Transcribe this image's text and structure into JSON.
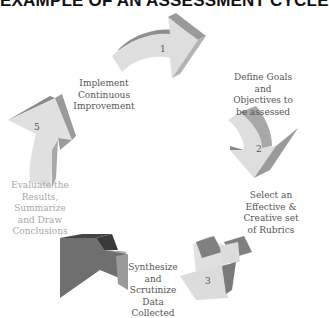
{
  "title": "EXAMPLE OF AN ASSESSMENT CYCLE",
  "steps": [
    {
      "number": "1",
      "label": "",
      "arrow_color": "#d6d6d6"
    },
    {
      "number": "2",
      "label": "Define Goals and Objectives to be assessed",
      "lines": [
        "Define Goals",
        "and",
        "Objectives to",
        "be assessed"
      ]
    },
    {
      "number": "3",
      "label": "Select an Effective & Creative set of Rubrics",
      "lines": [
        "Select an",
        "Effective &",
        "Creative set",
        "of  Rubrics"
      ]
    },
    {
      "number": "4",
      "label": "Synthesize and Scrutinize Data Collected",
      "lines": [
        "Synthesize",
        "and",
        "Scrutinize",
        "Data",
        "Collected"
      ]
    },
    {
      "number": "5",
      "label": "Evaluate the Results, Summarize and Draw Conclusions",
      "lines": [
        "Evaluate  the",
        "Results,",
        "Summarize",
        "and Draw",
        "Conclusions"
      ]
    }
  ],
  "labels": {
    "implement": [
      "Implement",
      "Continuous",
      "Improvement"
    ],
    "define": [
      "Define Goals",
      "and",
      "Objectives to",
      "be assessed"
    ],
    "select": [
      "Select an",
      "Effective &",
      "Creative set",
      "of  Rubrics"
    ],
    "synthesize": [
      "Synthesize",
      "and",
      "Scrutinize",
      "Data",
      "Collected"
    ],
    "evaluate": [
      "Evaluate  the",
      "Results,",
      "Summarize",
      "and Draw",
      "Conclusions"
    ]
  },
  "arrow_numbers": {
    "a1": "1",
    "a2": "2",
    "a3": "3",
    "a5": "5"
  },
  "colors": {
    "arrow_light": "#dcdcdc",
    "arrow_side": "#9a9a9a",
    "arrow_dark": "#6e6e6e",
    "arrow_dark_side": "#3a3a3a",
    "text": "#555555",
    "text_faint": "#a8a8a8"
  }
}
